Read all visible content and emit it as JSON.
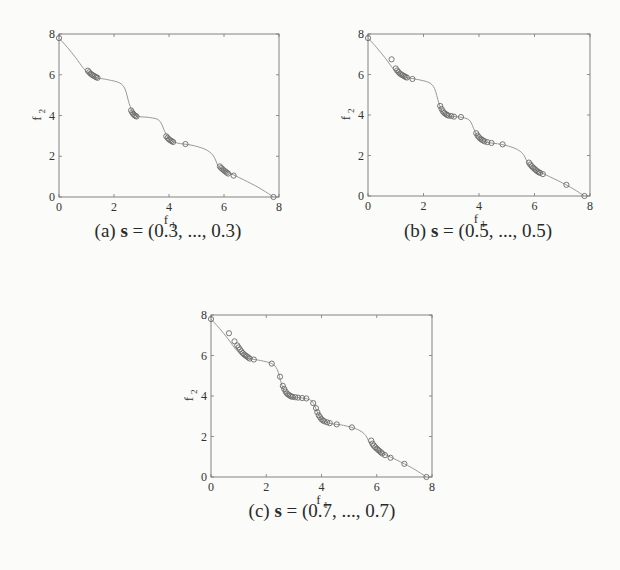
{
  "figure": {
    "panels": [
      {
        "id": "a",
        "caption_prefix": "(a)",
        "caption_var": "s",
        "caption_eq": " = (0.3, ..., 0.3)",
        "frame": {
          "x": 59,
          "y": 34,
          "w": 220,
          "h": 163
        },
        "caption_pos": {
          "x": 168,
          "y": 232
        }
      },
      {
        "id": "b",
        "caption_prefix": "(b)",
        "caption_var": "s",
        "caption_eq": " = (0.5, ..., 0.5)",
        "frame": {
          "x": 368,
          "y": 34,
          "w": 222,
          "h": 162
        },
        "caption_pos": {
          "x": 478,
          "y": 232
        }
      },
      {
        "id": "c",
        "caption_prefix": "(c)",
        "caption_var": "s",
        "caption_eq": " = (0.7, ..., 0.7)",
        "frame": {
          "x": 211,
          "y": 315,
          "w": 221,
          "h": 162
        },
        "caption_pos": {
          "x": 322,
          "y": 512
        }
      }
    ]
  },
  "chart_data": [
    {
      "type": "scatter",
      "title": "(a) s = (0.3, ..., 0.3)",
      "xlabel": "f1",
      "ylabel": "f2",
      "xlim": [
        0,
        8
      ],
      "ylim": [
        0,
        8
      ],
      "xticks": [
        0,
        2,
        4,
        6,
        8
      ],
      "yticks": [
        0,
        2,
        4,
        6,
        8
      ],
      "grid": false,
      "legend": null,
      "series": [
        {
          "name": "Pareto front (true)",
          "kind": "line",
          "x": [
            0,
            0.3,
            0.6,
            0.9,
            1.15,
            1.4,
            1.8,
            2.2,
            2.4,
            2.55,
            2.7,
            2.9,
            3.3,
            3.65,
            3.85,
            4.0,
            4.3,
            4.8,
            5.3,
            5.6,
            5.8,
            6.0,
            6.4,
            7.0,
            7.4,
            7.8
          ],
          "y": [
            7.8,
            7.35,
            6.85,
            6.3,
            6.0,
            5.85,
            5.75,
            5.6,
            5.3,
            4.6,
            4.1,
            3.95,
            3.9,
            3.75,
            3.2,
            2.85,
            2.65,
            2.55,
            2.35,
            2.05,
            1.5,
            1.3,
            1.05,
            0.65,
            0.35,
            0.0
          ]
        },
        {
          "name": "Obtained solutions",
          "kind": "markers",
          "x": [
            0,
            1.05,
            1.1,
            1.15,
            1.2,
            1.25,
            1.3,
            1.35,
            1.4,
            2.62,
            2.66,
            2.7,
            2.74,
            2.78,
            2.82,
            3.9,
            3.95,
            4.0,
            4.05,
            4.1,
            4.15,
            4.6,
            5.85,
            5.9,
            5.95,
            6.0,
            6.05,
            6.1,
            6.15,
            6.35,
            7.8
          ],
          "y": [
            7.8,
            6.2,
            6.12,
            6.05,
            6.0,
            5.96,
            5.92,
            5.88,
            5.85,
            4.25,
            4.15,
            4.08,
            4.02,
            3.98,
            3.95,
            2.98,
            2.9,
            2.83,
            2.78,
            2.74,
            2.7,
            2.6,
            1.5,
            1.42,
            1.36,
            1.3,
            1.25,
            1.2,
            1.15,
            1.05,
            0.0
          ]
        }
      ]
    },
    {
      "type": "scatter",
      "title": "(b) s = (0.5, ..., 0.5)",
      "xlabel": "f1",
      "ylabel": "f2",
      "xlim": [
        0,
        8
      ],
      "ylim": [
        0,
        8
      ],
      "xticks": [
        0,
        2,
        4,
        6,
        8
      ],
      "yticks": [
        0,
        2,
        4,
        6,
        8
      ],
      "grid": false,
      "legend": null,
      "series": [
        {
          "name": "Pareto front (true)",
          "kind": "line",
          "x": [
            0,
            0.3,
            0.6,
            0.9,
            1.15,
            1.4,
            1.8,
            2.2,
            2.4,
            2.55,
            2.7,
            2.9,
            3.3,
            3.65,
            3.85,
            4.0,
            4.3,
            4.8,
            5.3,
            5.6,
            5.8,
            6.0,
            6.4,
            7.0,
            7.4,
            7.8
          ],
          "y": [
            7.8,
            7.35,
            6.85,
            6.3,
            6.0,
            5.85,
            5.75,
            5.6,
            5.3,
            4.6,
            4.1,
            3.95,
            3.9,
            3.75,
            3.2,
            2.85,
            2.65,
            2.55,
            2.35,
            2.05,
            1.5,
            1.3,
            1.05,
            0.65,
            0.35,
            0.0
          ]
        },
        {
          "name": "Obtained solutions",
          "kind": "markers",
          "x": [
            0,
            0.85,
            1.0,
            1.05,
            1.1,
            1.15,
            1.2,
            1.25,
            1.3,
            1.35,
            1.4,
            1.6,
            2.6,
            2.65,
            2.7,
            2.75,
            2.8,
            2.85,
            2.9,
            3.0,
            3.1,
            3.35,
            3.9,
            3.95,
            4.0,
            4.05,
            4.1,
            4.15,
            4.2,
            4.3,
            4.45,
            4.85,
            5.8,
            5.85,
            5.9,
            5.95,
            6.0,
            6.05,
            6.1,
            6.15,
            6.2,
            6.3,
            7.15,
            7.8
          ],
          "y": [
            7.8,
            6.75,
            6.3,
            6.2,
            6.12,
            6.05,
            6.0,
            5.96,
            5.92,
            5.88,
            5.85,
            5.78,
            4.45,
            4.3,
            4.18,
            4.1,
            4.05,
            4.0,
            3.97,
            3.95,
            3.92,
            3.9,
            3.1,
            2.98,
            2.9,
            2.83,
            2.78,
            2.74,
            2.7,
            2.66,
            2.62,
            2.55,
            1.65,
            1.55,
            1.47,
            1.4,
            1.34,
            1.28,
            1.22,
            1.18,
            1.14,
            1.08,
            0.55,
            0.0
          ]
        }
      ]
    },
    {
      "type": "scatter",
      "title": "(c) s = (0.7, ..., 0.7)",
      "xlabel": "f1",
      "ylabel": "f2",
      "xlim": [
        0,
        8
      ],
      "ylim": [
        0,
        8
      ],
      "xticks": [
        0,
        2,
        4,
        6,
        8
      ],
      "yticks": [
        0,
        2,
        4,
        6,
        8
      ],
      "grid": false,
      "legend": null,
      "series": [
        {
          "name": "Pareto front (true)",
          "kind": "line",
          "x": [
            0,
            0.3,
            0.6,
            0.9,
            1.15,
            1.4,
            1.8,
            2.2,
            2.4,
            2.55,
            2.7,
            2.9,
            3.3,
            3.65,
            3.85,
            4.0,
            4.3,
            4.8,
            5.3,
            5.6,
            5.8,
            6.0,
            6.4,
            7.0,
            7.4,
            7.8
          ],
          "y": [
            7.8,
            7.35,
            6.85,
            6.3,
            6.0,
            5.85,
            5.75,
            5.6,
            5.3,
            4.6,
            4.1,
            3.95,
            3.9,
            3.75,
            3.2,
            2.85,
            2.65,
            2.55,
            2.35,
            2.05,
            1.5,
            1.3,
            1.05,
            0.65,
            0.35,
            0.0
          ]
        },
        {
          "name": "Obtained solutions",
          "kind": "markers",
          "x": [
            0,
            0.65,
            0.85,
            0.95,
            1.0,
            1.05,
            1.1,
            1.15,
            1.2,
            1.25,
            1.3,
            1.35,
            1.4,
            1.55,
            2.2,
            2.5,
            2.6,
            2.65,
            2.7,
            2.75,
            2.8,
            2.85,
            2.9,
            2.95,
            3.05,
            3.15,
            3.3,
            3.45,
            3.7,
            3.8,
            3.85,
            3.9,
            3.95,
            4.0,
            4.05,
            4.1,
            4.2,
            4.3,
            4.55,
            5.1,
            5.8,
            5.85,
            5.9,
            5.95,
            6.0,
            6.05,
            6.1,
            6.15,
            6.2,
            6.3,
            6.5,
            7.0,
            7.8
          ],
          "y": [
            7.8,
            7.1,
            6.7,
            6.5,
            6.4,
            6.3,
            6.2,
            6.12,
            6.05,
            6.0,
            5.95,
            5.9,
            5.85,
            5.8,
            5.6,
            4.95,
            4.5,
            4.35,
            4.22,
            4.12,
            4.07,
            4.02,
            3.98,
            3.96,
            3.94,
            3.92,
            3.9,
            3.88,
            3.65,
            3.4,
            3.2,
            3.05,
            2.95,
            2.85,
            2.8,
            2.75,
            2.7,
            2.66,
            2.6,
            2.45,
            1.8,
            1.65,
            1.55,
            1.47,
            1.4,
            1.34,
            1.28,
            1.22,
            1.16,
            1.08,
            0.95,
            0.65,
            0.0
          ]
        }
      ]
    }
  ],
  "style": {
    "curve_color": "#9a9a9a",
    "marker_color": "#6a6a6a",
    "frame_color": "#777777",
    "background": "#fbfbf9"
  }
}
